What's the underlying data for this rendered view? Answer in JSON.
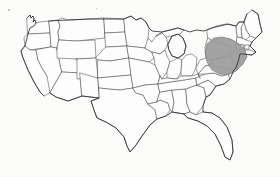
{
  "figure": {
    "kind": "map",
    "projection_look": "conic",
    "title": "",
    "caption": "",
    "background_color": "#fcfcfb",
    "border_color": "#4a4a48",
    "coastline_color": "#2e2e2c",
    "width_px": 280,
    "height_px": 177
  },
  "highlight": {
    "label": "",
    "fill_color": "#9b9b9b",
    "stroke_color": "#6f6f6f",
    "description": "shaded Mid-Atlantic region",
    "covers": [
      "Pennsylvania",
      "New Jersey",
      "Maryland",
      "Delaware",
      "southern New York",
      "eastern West Virginia"
    ],
    "bounds_px": {
      "x": 205,
      "y": 37,
      "width": 43,
      "height": 38
    }
  },
  "artifacts": [
    {
      "name": "scan-speck",
      "x": 8,
      "y": 9,
      "size": 2
    },
    {
      "name": "scan-speck",
      "x": 96,
      "y": 8,
      "size": 1
    }
  ],
  "regions": {
    "west": [
      "Washington",
      "Oregon",
      "California",
      "Idaho",
      "Nevada",
      "Utah",
      "Arizona",
      "Montana",
      "Wyoming",
      "Colorado",
      "New Mexico"
    ],
    "plains": [
      "North Dakota",
      "South Dakota",
      "Nebraska",
      "Kansas",
      "Oklahoma",
      "Texas"
    ],
    "midwest": [
      "Minnesota",
      "Iowa",
      "Missouri",
      "Wisconsin",
      "Illinois",
      "Michigan",
      "Indiana",
      "Ohio"
    ],
    "south": [
      "Arkansas",
      "Louisiana",
      "Mississippi",
      "Alabama",
      "Tennessee",
      "Kentucky",
      "Georgia",
      "Florida",
      "South Carolina",
      "North Carolina",
      "Virginia",
      "West Virginia"
    ],
    "northeast": [
      "Maine",
      "New Hampshire",
      "Vermont",
      "Massachusetts",
      "Rhode Island",
      "Connecticut",
      "New York",
      "Pennsylvania",
      "New Jersey",
      "Delaware",
      "Maryland"
    ]
  }
}
